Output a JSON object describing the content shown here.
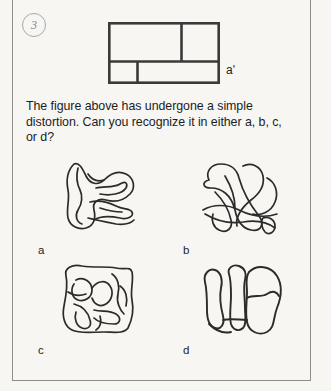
{
  "page": {
    "item_number": "3",
    "background_color": "#f7f6f3",
    "ink_color": "#1d1d1b",
    "border_color": "#8d8d8a"
  },
  "stimulus": {
    "name": "subdivided-rectangle",
    "label": "a'",
    "description": "Rectangle divided into four cells: upper row split into a wide left cell and a narrower right cell; lower row split into a narrow left cell and a wide right cell.",
    "cells": [
      {
        "id": "top-left",
        "row": "top",
        "relative_width": 0.66
      },
      {
        "id": "top-right",
        "row": "top",
        "relative_width": 0.34
      },
      {
        "id": "bottom-left",
        "row": "bottom",
        "relative_width": 0.26
      },
      {
        "id": "bottom-right",
        "row": "bottom",
        "relative_width": 0.74
      }
    ],
    "row_split_ratio": 0.63
  },
  "prompt": {
    "text": "The figure above has undergone a simple distortion. Can you recognize it in either a, b, c, or d?"
  },
  "options": [
    {
      "label": "a",
      "name": "option-a",
      "description": "Curvilinear maze-like closed outline with finger-like lobes projecting to the right."
    },
    {
      "label": "b",
      "name": "option-b",
      "description": "Interlaced diagonal loops forming a woven band pattern."
    },
    {
      "label": "c",
      "name": "option-c",
      "description": "Rounded square outline enclosing a winding serpentine channel."
    },
    {
      "label": "d",
      "name": "option-d",
      "description": "Rubber-sheet distortion of the rectangle: a narrow left strip beside a large rounded right region divided into upper and lower parts."
    }
  ]
}
